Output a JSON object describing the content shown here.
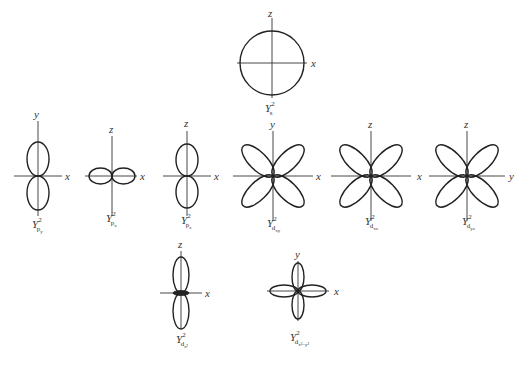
{
  "diagram": {
    "orbitals": [
      {
        "id": "s",
        "label_main": "Y",
        "power": "2",
        "sub": "s",
        "subsub": "",
        "axes": {
          "vertical": "z",
          "horizontal": "x"
        },
        "shape": "circle"
      },
      {
        "id": "py",
        "label_main": "Y",
        "power": "2",
        "sub": "p",
        "subsub": "y",
        "axes": {
          "vertical": "y",
          "horizontal": "x"
        },
        "shape": "two-lobes-vertical"
      },
      {
        "id": "px",
        "label_main": "Y",
        "power": "2",
        "sub": "p",
        "subsub": "x",
        "axes": {
          "vertical": "z",
          "horizontal": "x"
        },
        "shape": "two-lobes-horizontal"
      },
      {
        "id": "pz",
        "label_main": "Y",
        "power": "2",
        "sub": "p",
        "subsub": "z",
        "axes": {
          "vertical": "z",
          "horizontal": "x"
        },
        "shape": "two-lobes-vertical"
      },
      {
        "id": "dxy",
        "label_main": "Y",
        "power": "2",
        "sub": "d",
        "subsub": "xy",
        "axes": {
          "vertical": "y",
          "horizontal": "x"
        },
        "shape": "four-lobes-diagonal"
      },
      {
        "id": "dxz",
        "label_main": "Y",
        "power": "2",
        "sub": "d",
        "subsub": "xz",
        "axes": {
          "vertical": "z",
          "horizontal": "x"
        },
        "shape": "four-lobes-diagonal"
      },
      {
        "id": "dyz",
        "label_main": "Y",
        "power": "2",
        "sub": "d",
        "subsub": "yz",
        "axes": {
          "vertical": "z",
          "horizontal": "y"
        },
        "shape": "four-lobes-diagonal"
      },
      {
        "id": "dz2",
        "label_main": "Y",
        "power": "2",
        "sub": "d",
        "subsub": "z²",
        "axes": {
          "vertical": "z",
          "horizontal": "x"
        },
        "shape": "two-lobes-with-torus"
      },
      {
        "id": "dx2y2",
        "label_main": "Y",
        "power": "2",
        "sub": "d",
        "subsub": "x²−y²",
        "axes": {
          "vertical": "y",
          "horizontal": "x"
        },
        "shape": "four-lobes-axial"
      }
    ]
  }
}
